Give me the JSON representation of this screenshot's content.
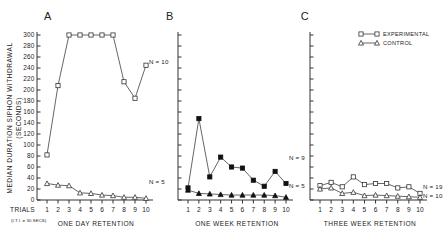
{
  "figure": {
    "y_axis_label_line1": "MEDIAN DURATION SIPHON WITHDRAWAL",
    "y_axis_label_line2": "(SECONDS)",
    "trials_word": "TRIALS",
    "iti_note": "(I.T.I. = 30 SECS)"
  },
  "legend": {
    "experimental": "EXPERIMENTAL",
    "control": "CONTROL"
  },
  "panels": [
    {
      "letter": "A",
      "caption": "ONE DAY RETENTION",
      "n_experimental": "N = 10",
      "n_control": "N = 5"
    },
    {
      "letter": "B",
      "caption": "ONE WEEK RETENTION",
      "n_experimental": "N = 9",
      "n_control": "N = 5"
    },
    {
      "letter": "C",
      "caption": "THREE WEEK RETENTION",
      "n_experimental": "N = 19",
      "n_control": "N = 10"
    }
  ],
  "chart_data": [
    {
      "type": "line",
      "panel": "A",
      "title": "ONE DAY RETENTION",
      "xlabel": "TRIALS",
      "ylabel": "MEDIAN DURATION SIPHON WITHDRAWAL (SECONDS)",
      "x": [
        1,
        2,
        3,
        4,
        5,
        6,
        7,
        8,
        9,
        10
      ],
      "xtick_labels": [
        "1",
        "2",
        "3",
        "4",
        "5",
        "6",
        "7",
        "8",
        "9",
        "10"
      ],
      "ylim": [
        0,
        300
      ],
      "ytick_values": [
        0,
        20,
        40,
        60,
        80,
        100,
        120,
        140,
        160,
        180,
        200,
        220,
        240,
        260,
        280,
        300
      ],
      "ytick_labels": [
        "0",
        "20",
        "40",
        "60",
        "80",
        "100",
        "120",
        "140",
        "160",
        "180",
        "200",
        "220",
        "240",
        "260",
        "280",
        "300"
      ],
      "grid": false,
      "series": [
        {
          "name": "EXPERIMENTAL",
          "marker": "open-square",
          "n": 10,
          "values": [
            82,
            208,
            300,
            300,
            300,
            300,
            300,
            215,
            185,
            245
          ]
        },
        {
          "name": "CONTROL",
          "marker": "open-triangle",
          "n": 5,
          "values": [
            30,
            27,
            26,
            13,
            12,
            9,
            8,
            5,
            5,
            3
          ]
        }
      ]
    },
    {
      "type": "line",
      "panel": "B",
      "title": "ONE WEEK RETENTION",
      "xlabel": "TRIALS",
      "ylabel": "MEDIAN DURATION SIPHON WITHDRAWAL (SECONDS)",
      "x": [
        1,
        2,
        3,
        4,
        5,
        6,
        7,
        8,
        9,
        10
      ],
      "xtick_labels": [
        "1",
        "2",
        "3",
        "4",
        "5",
        "6",
        "7",
        "8",
        "9",
        "10"
      ],
      "ylim": [
        0,
        300
      ],
      "grid": false,
      "series": [
        {
          "name": "EXPERIMENTAL",
          "marker": "filled-square",
          "n": 9,
          "values": [
            22,
            148,
            42,
            78,
            60,
            58,
            36,
            25,
            52,
            30
          ]
        },
        {
          "name": "CONTROL",
          "marker": "filled-triangle",
          "n": 5,
          "values": [
            18,
            12,
            11,
            10,
            9,
            9,
            9,
            9,
            8,
            5
          ]
        }
      ]
    },
    {
      "type": "line",
      "panel": "C",
      "title": "THREE WEEK RETENTION",
      "xlabel": "TRIALS",
      "ylabel": "MEDIAN DURATION SIPHON WITHDRAWAL (SECONDS)",
      "x": [
        1,
        2,
        3,
        4,
        5,
        6,
        7,
        8,
        9,
        10
      ],
      "xtick_labels": [
        "1",
        "2",
        "3",
        "4",
        "5",
        "6",
        "7",
        "8",
        "9",
        "10"
      ],
      "ylim": [
        0,
        300
      ],
      "grid": false,
      "series": [
        {
          "name": "EXPERIMENTAL",
          "marker": "open-square",
          "n": 19,
          "values": [
            26,
            32,
            24,
            42,
            28,
            30,
            30,
            22,
            24,
            12
          ]
        },
        {
          "name": "CONTROL",
          "marker": "open-triangle",
          "n": 10,
          "values": [
            20,
            22,
            12,
            14,
            8,
            9,
            8,
            7,
            6,
            5
          ]
        }
      ]
    }
  ]
}
